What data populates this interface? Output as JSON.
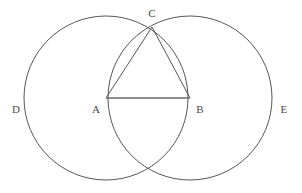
{
  "figure": {
    "kind": "geometry-diagram",
    "canvas": {
      "width": 302,
      "height": 193
    },
    "background_color": "#ffffff",
    "stroke_color": "#555555",
    "segment_color": "#6b6b6b",
    "label_color": "#4a4a4a"
  },
  "points": [
    {
      "id": "A",
      "label": "A",
      "role": "left-circle-center",
      "x": 106,
      "y": 98,
      "label_x": 96,
      "label_y": 109
    },
    {
      "id": "B",
      "label": "B",
      "role": "right-circle-center",
      "x": 190,
      "y": 98,
      "label_x": 200,
      "label_y": 109
    },
    {
      "id": "C",
      "label": "C",
      "role": "upper-intersection",
      "x": 152,
      "y": 27,
      "label_x": 152,
      "label_y": 13
    },
    {
      "id": "F",
      "label": "",
      "role": "lower-intersection",
      "x": 152,
      "y": 172,
      "label_x": 152,
      "label_y": 182
    },
    {
      "id": "D",
      "label": "D",
      "role": "left-circle-arc-label",
      "x": 24,
      "y": 98,
      "label_x": 16,
      "label_y": 109
    },
    {
      "id": "E",
      "label": "E",
      "role": "right-circle-arc-label",
      "x": 272,
      "y": 98,
      "label_x": 284,
      "label_y": 109
    }
  ],
  "circles": [
    {
      "id": "circle-A",
      "center": "A",
      "cx": 106,
      "cy": 98,
      "r": 82,
      "stroke_width": 1
    },
    {
      "id": "circle-B",
      "center": "B",
      "cx": 190,
      "cy": 98,
      "r": 82,
      "stroke_width": 1
    }
  ],
  "segments": [
    {
      "id": "segment-AB",
      "from": "A",
      "to": "B",
      "x1": 106,
      "y1": 98,
      "x2": 190,
      "y2": 98,
      "stroke_width": 1.6
    },
    {
      "id": "segment-CA",
      "from": "C",
      "to": "A",
      "x1": 152,
      "y1": 27,
      "x2": 106,
      "y2": 98,
      "stroke_width": 1
    },
    {
      "id": "segment-CB",
      "from": "C",
      "to": "B",
      "x1": 152,
      "y1": 27,
      "x2": 190,
      "y2": 98,
      "stroke_width": 1
    }
  ]
}
